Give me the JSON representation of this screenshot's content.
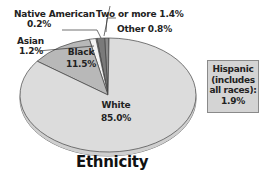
{
  "chart_data": {
    "type": "pie",
    "title": "Ethnicity",
    "slices": [
      {
        "label": "White",
        "value": 85.0,
        "display": "85.0%",
        "color": "#dcdcdc"
      },
      {
        "label": "Black",
        "value": 11.5,
        "display": "11.5%",
        "color": "#b8b8b8"
      },
      {
        "label": "Asian",
        "value": 1.2,
        "display": "1.2%",
        "color": "#f4f4f4"
      },
      {
        "label": "Native American",
        "value": 0.2,
        "display": "0.2%",
        "color": "#9a9a9a"
      },
      {
        "label": "Two or more",
        "value": 1.4,
        "display": "1.4%",
        "color": "#7a7a7a"
      },
      {
        "label": "Other",
        "value": 0.8,
        "display": "0.8%",
        "color": "#8c8c8c"
      }
    ],
    "annotation": {
      "label": "Hispanic (includes all races)",
      "value": 1.9,
      "display": "1.9%"
    },
    "legend": "none (direct labels)",
    "style": "3D tilted pie"
  },
  "labels": {
    "white_name": "White",
    "white_value": "85.0%",
    "black_name": "Black",
    "black_value": "11.5%",
    "asian_name": "Asian",
    "asian_value": "1.2%",
    "native_name": "Native American",
    "native_value": "0.2%",
    "two_more": "Two or more 1.4%",
    "other": "Other 0.8%"
  },
  "hispanic": {
    "line1": "Hispanic",
    "line2": "(includes",
    "line3": "all races):",
    "line4": "1.9%"
  },
  "title": "Ethnicity"
}
